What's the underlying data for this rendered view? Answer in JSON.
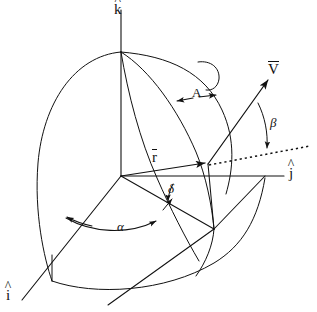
{
  "figure": {
    "background_color": "#ffffff",
    "stroke_color": "#111111",
    "width": 317,
    "height": 312
  },
  "axes": [
    {
      "id": "k",
      "label": "k",
      "accent": "^",
      "name": "k-hat-axis",
      "description": "vertical axis pointing up"
    },
    {
      "id": "j",
      "label": "j",
      "accent": "^",
      "name": "j-hat-axis",
      "description": "horizontal axis pointing right"
    },
    {
      "id": "i",
      "label": "i",
      "accent": "^",
      "name": "i-hat-axis",
      "description": "axis pointing down-left toward viewer"
    }
  ],
  "vectors": [
    {
      "id": "r",
      "label": "r",
      "accent": "bar",
      "name": "position-vector-r",
      "description": "position vector from origin to point on sphere"
    },
    {
      "id": "V",
      "label": "V",
      "accent": "bar",
      "name": "velocity-vector-v",
      "description": "velocity vector at the surface point"
    }
  ],
  "angles": [
    {
      "id": "A",
      "label": "A",
      "name": "angle-A",
      "description": "azimuth angle measured at the north pole between meridians"
    },
    {
      "id": "beta",
      "label": "β",
      "name": "angle-beta",
      "description": "angle between velocity vector and local horizontal dotted reference"
    },
    {
      "id": "delta",
      "label": "δ",
      "name": "angle-delta",
      "description": "small angle at origin between r and the reference line"
    },
    {
      "id": "alpha",
      "label": "α",
      "name": "angle-alpha",
      "description": "angle in the equatorial plane measured from the i-hat direction"
    }
  ],
  "reference_lines": [
    {
      "id": "dotted",
      "style": "dotted",
      "name": "dotted-reference-line",
      "description": "local horizontal reference through the surface point"
    }
  ],
  "labels": {
    "k_hat": "k",
    "j_hat": "j",
    "i_hat": "i",
    "r_bar": "r",
    "v_bar": "V",
    "angle_A": "A",
    "angle_beta": "β",
    "angle_delta": "δ",
    "angle_alpha": "α",
    "hat_accent": "^"
  }
}
